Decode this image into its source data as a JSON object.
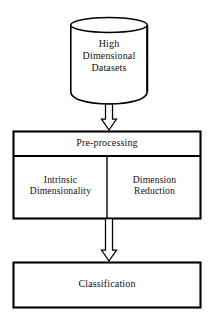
{
  "diagram": {
    "type": "flowchart",
    "orientation": "top-to-bottom",
    "background_color": "#ffffff",
    "stroke_color": "#000000",
    "text_color": "#111111",
    "nodes": [
      {
        "id": "high-dimensional-datasets",
        "shape": "cylinder",
        "lines": [
          "High",
          "Dimensional",
          "Datasets"
        ],
        "text": "High Dimensional Datasets"
      },
      {
        "id": "pre-processing",
        "shape": "rectangle",
        "header": "Pre-processing",
        "cells": [
          {
            "id": "intrinsic-dimensionality",
            "lines": [
              "Intrinsic",
              "Dimensionality"
            ],
            "text": "Intrinsic Dimensionality"
          },
          {
            "id": "dimension-reduction",
            "lines": [
              "Dimension",
              "Reduction"
            ],
            "text": "Dimension Reduction"
          }
        ]
      },
      {
        "id": "classification",
        "shape": "rectangle",
        "text": "Classification"
      }
    ],
    "connectors": [
      {
        "id": "datasets-to-preprocessing",
        "style": "hollow-block-arrow",
        "from": "high-dimensional-datasets",
        "to": "pre-processing",
        "direction": "down"
      },
      {
        "id": "preprocessing-to-classification",
        "style": "hollow-block-arrow",
        "from": "pre-processing",
        "to": "classification",
        "direction": "down"
      }
    ]
  }
}
